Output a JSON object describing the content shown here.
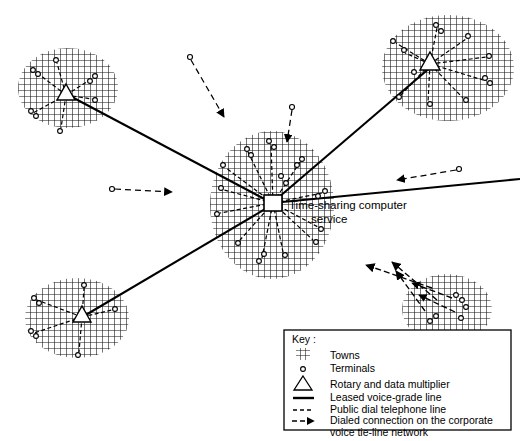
{
  "figure": {
    "hub_label_line1": "Time-sharing computer",
    "hub_label_line2": "service"
  },
  "legend": {
    "heading": "Key :",
    "items": [
      {
        "symbol": "crosshatch-swatch",
        "label": "Towns"
      },
      {
        "symbol": "small-circle",
        "label": "Terminals"
      },
      {
        "symbol": "triangle",
        "label": "Rotary and data multiplier"
      },
      {
        "symbol": "solid-line",
        "label": "Leased voice-grade line"
      },
      {
        "symbol": "dashed-line",
        "label": "Public dial telephone line"
      },
      {
        "symbol": "dash-arrow",
        "label": "Dialed connection on the corporate"
      },
      {
        "symbol": "none",
        "label": "voice tie-line network"
      }
    ]
  },
  "colors": {
    "ink": "#000000",
    "paper": "#ffffff",
    "hatch": "#1a1a1a",
    "town_fill": "#ffffff"
  },
  "towns": [
    {
      "name": "town-top-left",
      "cx": 68,
      "cy": 88,
      "rx": 50,
      "ry": 40,
      "hub": "triangle",
      "hub_x": 66,
      "hub_y": 95
    },
    {
      "name": "town-top-right",
      "cx": 448,
      "cy": 68,
      "rx": 66,
      "ry": 53,
      "hub": "triangle",
      "hub_x": 430,
      "hub_y": 64
    },
    {
      "name": "town-center",
      "cx": 272,
      "cy": 205,
      "rx": 62,
      "ry": 74,
      "hub": "square",
      "hub_x": 273,
      "hub_y": 203
    },
    {
      "name": "town-bottom-left",
      "cx": 77,
      "cy": 318,
      "rx": 52,
      "ry": 40,
      "hub": "triangle",
      "hub_x": 82,
      "hub_y": 317
    },
    {
      "name": "town-bottom-right",
      "cx": 447,
      "cy": 309,
      "rx": 45,
      "ry": 35,
      "hub": "none",
      "hub_x": 0,
      "hub_y": 0
    }
  ],
  "leased_lines": [
    {
      "name": "leased-topleft-to-center",
      "x1": 70,
      "y1": 96,
      "x2": 272,
      "y2": 203
    },
    {
      "name": "leased-center-to-topright",
      "x1": 272,
      "y1": 203,
      "x2": 432,
      "y2": 66
    },
    {
      "name": "leased-bottomleft-to-center",
      "x1": 84,
      "y1": 316,
      "x2": 272,
      "y2": 205
    },
    {
      "name": "leased-center-to-right-edge",
      "x1": 272,
      "y1": 203,
      "x2": 520,
      "y2": 179
    }
  ],
  "public_dial_arrows": [
    {
      "name": "dial-arrow-top",
      "x1": 191,
      "y1": 58,
      "x2": 224,
      "y2": 117,
      "terminal": "start"
    },
    {
      "name": "dial-arrow-upper-mid",
      "x1": 292,
      "y1": 107,
      "x2": 286,
      "y2": 142,
      "terminal": "start"
    },
    {
      "name": "dial-arrow-left",
      "x1": 112,
      "y1": 189,
      "x2": 172,
      "y2": 192,
      "terminal": "start"
    },
    {
      "name": "dial-arrow-right",
      "x1": 459,
      "y1": 169,
      "x2": 397,
      "y2": 180,
      "terminal": "start"
    }
  ],
  "dialed_connections": [
    {
      "name": "dialed-conn-1",
      "x1": 432,
      "y1": 288,
      "x2": 366,
      "y2": 265
    },
    {
      "name": "dialed-conn-2",
      "x1": 437,
      "y1": 300,
      "x2": 392,
      "y2": 262
    },
    {
      "name": "dialed-conn-3",
      "x1": 425,
      "y1": 311,
      "x2": 396,
      "y2": 271
    }
  ],
  "counts": {
    "towns": 5,
    "leased_lines": 4,
    "public_dial_lines": 4,
    "dialed_connections": 3
  }
}
